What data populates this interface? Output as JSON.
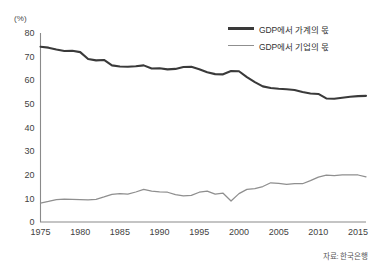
{
  "chart_data": {
    "type": "line",
    "title": "",
    "subtitle": "",
    "unit_label": "(%)",
    "xlabel": "",
    "ylabel": "",
    "xlim": [
      1975,
      2016
    ],
    "ylim": [
      0,
      80
    ],
    "grid": false,
    "legend_position": "top-right",
    "source": "자료: 한국은행",
    "y_ticks": [
      0,
      10,
      20,
      30,
      40,
      50,
      60,
      70,
      80
    ],
    "x_ticks": [
      1975,
      1980,
      1985,
      1990,
      1995,
      2000,
      2005,
      2010,
      2015
    ],
    "x": [
      1975,
      1976,
      1977,
      1978,
      1979,
      1980,
      1981,
      1982,
      1983,
      1984,
      1985,
      1986,
      1987,
      1988,
      1989,
      1990,
      1991,
      1992,
      1993,
      1994,
      1995,
      1996,
      1997,
      1998,
      1999,
      2000,
      2001,
      2002,
      2003,
      2004,
      2005,
      2006,
      2007,
      2008,
      2009,
      2010,
      2011,
      2012,
      2013,
      2014,
      2015,
      2016
    ],
    "series": [
      {
        "name": "GDP에서 가계의 몫",
        "color": "#3a3a3a",
        "width": "thick",
        "values": [
          74.2,
          73.8,
          73.0,
          72.4,
          72.5,
          71.9,
          69.0,
          68.4,
          68.6,
          66.3,
          65.8,
          65.7,
          65.9,
          66.3,
          65.0,
          65.1,
          64.6,
          64.8,
          65.6,
          65.7,
          64.7,
          63.4,
          62.6,
          62.5,
          63.9,
          63.8,
          61.3,
          59.2,
          57.4,
          56.7,
          56.4,
          56.2,
          55.9,
          55.0,
          54.4,
          54.2,
          52.3,
          52.2,
          52.6,
          53.0,
          53.3,
          53.4
        ]
      },
      {
        "name": "GDP에서 기업의 몫",
        "color": "#8f8f8f",
        "width": "thin",
        "values": [
          8.0,
          8.7,
          9.5,
          9.7,
          9.6,
          9.5,
          9.4,
          9.6,
          10.6,
          11.7,
          12.0,
          11.8,
          12.7,
          13.8,
          13.1,
          12.8,
          12.6,
          11.6,
          11.1,
          11.3,
          12.6,
          13.1,
          11.8,
          12.2,
          8.9,
          12.0,
          13.8,
          14.1,
          15.0,
          16.6,
          16.3,
          15.9,
          16.2,
          16.2,
          17.5,
          19.0,
          19.8,
          19.6,
          19.9,
          20.0,
          19.9,
          19.1
        ]
      }
    ]
  },
  "legend": {
    "items": [
      {
        "label": "GDP에서 가계의 몫",
        "style": "thick"
      },
      {
        "label": "GDP에서 기업의 몫",
        "style": "thin"
      }
    ]
  },
  "source_note": "자료: 한국은행",
  "unit": "(%)",
  "colors": {
    "household": "#3a3a3a",
    "corporate": "#8f8f8f",
    "axis": "#8a8a8a",
    "text": "#333333",
    "background": "#ffffff"
  }
}
